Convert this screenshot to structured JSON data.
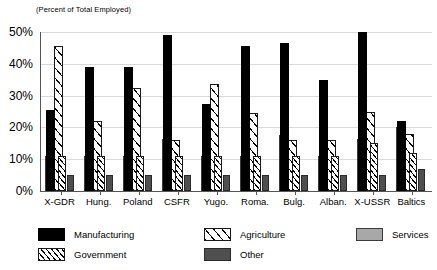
{
  "chart_data": {
    "type": "bar",
    "title": "(Percent of Total Employed)",
    "subtitle": "(Percent of Total Employed)",
    "xlabel": "",
    "ylabel": "",
    "ylim": [
      0,
      50
    ],
    "yticks": [
      "0%",
      "10%",
      "20%",
      "30%",
      "40%",
      "50%"
    ],
    "ytick_values": [
      0,
      10,
      20,
      30,
      40,
      50
    ],
    "grid": true,
    "legend_position": "bottom",
    "categories": [
      "X-GDR",
      "Hung.",
      "Poland",
      "CSFR",
      "Yugo.",
      "Roma.",
      "Bulg.",
      "Alban.",
      "X-USSR",
      "Baltics"
    ],
    "series": [
      {
        "name": "Manufacturing",
        "color": "#000000",
        "pattern": "solid",
        "values": [
          25.5,
          39.0,
          39.0,
          49.0,
          27.5,
          45.5,
          46.5,
          35.0,
          50.0,
          22.0
        ]
      },
      {
        "name": "Agriculture",
        "color": "#ffffff",
        "pattern": "diagonal-sparse",
        "values": [
          45.5,
          22.0,
          32.5,
          16.0,
          33.5,
          24.5,
          16.0,
          16.0,
          25.0,
          18.0
        ]
      },
      {
        "name": "Services",
        "color": "#a8a8a8",
        "pattern": "solid",
        "values": [
          11.0,
          11.0,
          11.0,
          16.5,
          11.0,
          11.0,
          17.5,
          11.0,
          16.5,
          20.0
        ]
      },
      {
        "name": "Government",
        "color": "#ffffff",
        "pattern": "diagonal-dense",
        "values": [
          11.0,
          11.0,
          11.0,
          11.0,
          11.0,
          11.0,
          11.0,
          11.0,
          15.0,
          12.0
        ]
      },
      {
        "name": "Other",
        "color": "#4f4f4f",
        "pattern": "solid",
        "values": [
          5.0,
          5.0,
          5.0,
          5.0,
          5.0,
          5.0,
          5.0,
          5.0,
          5.0,
          7.0
        ]
      }
    ]
  }
}
